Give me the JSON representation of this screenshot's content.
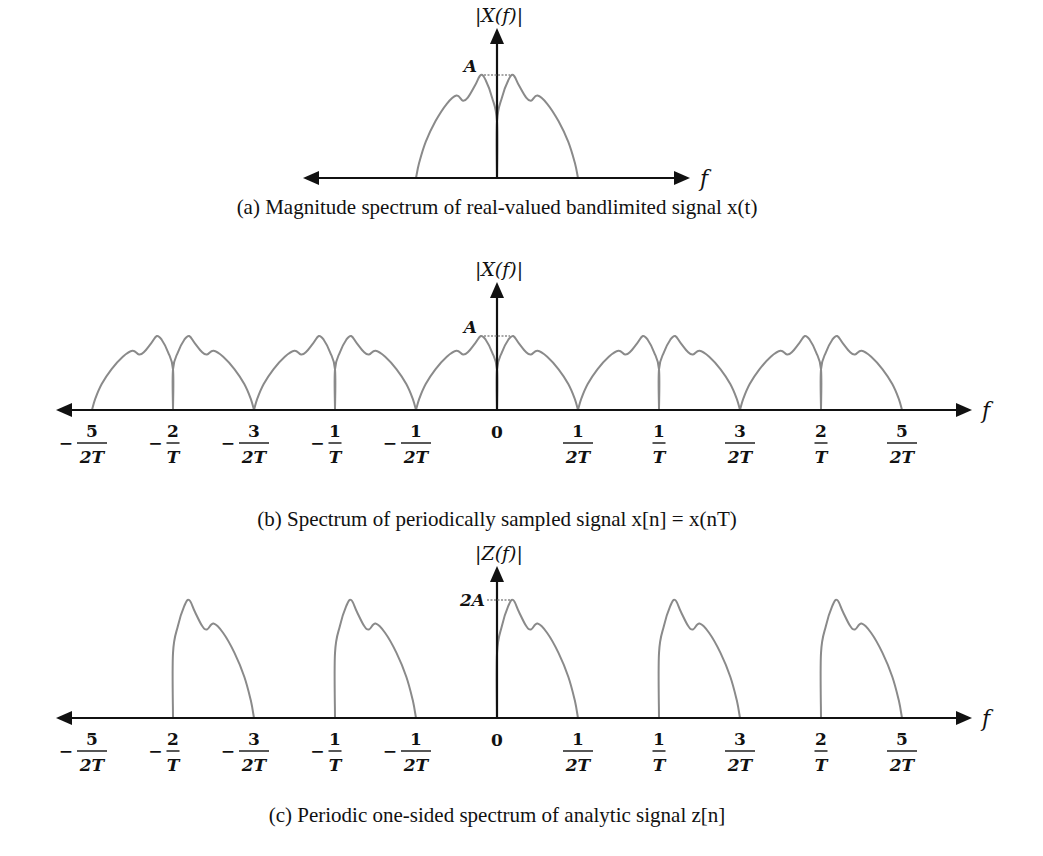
{
  "panels": [
    {
      "id": "a",
      "caption": "(a) Magnitude spectrum of real-valued bandlimited signal x(t)",
      "y_label": "|X(f)|",
      "x_label": "f",
      "level_label": "A",
      "lobe_width": 81,
      "center_x": 497,
      "axis_y": 178,
      "axis_x_range": [
        303,
        690
      ],
      "y_arrow_top": 28,
      "level_y": 75,
      "lobes": [
        {
          "start": -1,
          "mirror": true
        },
        {
          "start": 0,
          "mirror": false
        }
      ],
      "ticks": []
    },
    {
      "id": "b",
      "caption": "(b) Spectrum of periodically sampled signal x[n] = x(nT)",
      "y_label": "|X(f)|",
      "x_label": "f",
      "level_label": "A",
      "lobe_width": 81,
      "center_x": 497,
      "axis_y": 410,
      "axis_x_range": [
        56,
        972
      ],
      "y_arrow_top": 282,
      "level_y": 336,
      "lobes": [
        {
          "start": -5,
          "mirror": true
        },
        {
          "start": -4,
          "mirror": false
        },
        {
          "start": -3,
          "mirror": true
        },
        {
          "start": -2,
          "mirror": false
        },
        {
          "start": -1,
          "mirror": true
        },
        {
          "start": 0,
          "mirror": false
        },
        {
          "start": 1,
          "mirror": true
        },
        {
          "start": 2,
          "mirror": false
        },
        {
          "start": 3,
          "mirror": true
        },
        {
          "start": 4,
          "mirror": false
        }
      ],
      "ticks": [
        {
          "k": -5,
          "sign": "−",
          "num": "5",
          "den": "2T"
        },
        {
          "k": -4,
          "sign": "−",
          "num": "2",
          "den": "T"
        },
        {
          "k": -3,
          "sign": "−",
          "num": "3",
          "den": "2T"
        },
        {
          "k": -2,
          "sign": "−",
          "num": "1",
          "den": "T"
        },
        {
          "k": -1,
          "sign": "−",
          "num": "1",
          "den": "2T"
        },
        {
          "k": 0,
          "sign": "",
          "num": "0",
          "den": ""
        },
        {
          "k": 1,
          "sign": "",
          "num": "1",
          "den": "2T"
        },
        {
          "k": 2,
          "sign": "",
          "num": "1",
          "den": "T"
        },
        {
          "k": 3,
          "sign": "",
          "num": "3",
          "den": "2T"
        },
        {
          "k": 4,
          "sign": "",
          "num": "2",
          "den": "T"
        },
        {
          "k": 5,
          "sign": "",
          "num": "5",
          "den": "2T"
        }
      ]
    },
    {
      "id": "c",
      "caption": "(c) Periodic one-sided spectrum of analytic signal z[n]",
      "y_label": "|Z(f)|",
      "x_label": "f",
      "level_label": "2A",
      "lobe_width": 81,
      "center_x": 497,
      "axis_y": 718,
      "axis_x_range": [
        56,
        972
      ],
      "y_arrow_top": 566,
      "level_y": 600,
      "lobes": [
        {
          "start": -4,
          "mirror": false
        },
        {
          "start": -2,
          "mirror": false
        },
        {
          "start": 0,
          "mirror": false
        },
        {
          "start": 2,
          "mirror": false
        },
        {
          "start": 4,
          "mirror": false
        }
      ],
      "ticks": [
        {
          "k": -5,
          "sign": "−",
          "num": "5",
          "den": "2T"
        },
        {
          "k": -4,
          "sign": "−",
          "num": "2",
          "den": "T"
        },
        {
          "k": -3,
          "sign": "−",
          "num": "3",
          "den": "2T"
        },
        {
          "k": -2,
          "sign": "−",
          "num": "1",
          "den": "T"
        },
        {
          "k": -1,
          "sign": "−",
          "num": "1",
          "den": "2T"
        },
        {
          "k": 0,
          "sign": "",
          "num": "0",
          "den": ""
        },
        {
          "k": 1,
          "sign": "",
          "num": "1",
          "den": "2T"
        },
        {
          "k": 2,
          "sign": "",
          "num": "1",
          "den": "T"
        },
        {
          "k": 3,
          "sign": "",
          "num": "3",
          "den": "2T"
        },
        {
          "k": 4,
          "sign": "",
          "num": "2",
          "den": "T"
        },
        {
          "k": 5,
          "sign": "",
          "num": "5",
          "den": "2T"
        }
      ]
    }
  ],
  "lobe_shape": {
    "note": "normalized lobe profile from band edge at origin (x=0) to outer edge (x=1); y = fraction of axis-to-level height",
    "points": [
      [
        0,
        0.0
      ],
      [
        0.0,
        0.55
      ],
      [
        0.06,
        0.78
      ],
      [
        0.14,
        0.95
      ],
      [
        0.2,
        1.0
      ],
      [
        0.27,
        0.9
      ],
      [
        0.36,
        0.78
      ],
      [
        0.42,
        0.75
      ],
      [
        0.5,
        0.8
      ],
      [
        0.62,
        0.72
      ],
      [
        0.76,
        0.55
      ],
      [
        0.88,
        0.35
      ],
      [
        0.96,
        0.15
      ],
      [
        1.0,
        0.0
      ]
    ]
  },
  "chart_data": [
    {
      "type": "line",
      "title": "(a) Magnitude spectrum of real-valued bandlimited signal x(t)",
      "xlabel": "f",
      "ylabel": "|X(f)|",
      "annotations": [
        "A"
      ],
      "description": "Symmetric bandlimited magnitude spectrum around f=0, peak level A near the center with a notch at f=0",
      "x_range_normalized": [
        -0.5,
        0.5
      ],
      "peak": "A"
    },
    {
      "type": "line",
      "title": "(b) Spectrum of periodically sampled signal x[n] = x(nT)",
      "xlabel": "f",
      "ylabel": "|X(f)|",
      "tick_labels": [
        "-5/2T",
        "-2/T",
        "-3/2T",
        "-1/T",
        "-1/2T",
        "0",
        "1/2T",
        "1/T",
        "3/2T",
        "2/T",
        "5/2T"
      ],
      "annotations": [
        "A"
      ],
      "description": "Periodic replicas of spectrum (a) repeating every 1/T, filling -5/2T to 5/2T; peak level A",
      "peak": "A"
    },
    {
      "type": "line",
      "title": "(c) Periodic one-sided spectrum of analytic signal z[n]",
      "xlabel": "f",
      "ylabel": "|Z(f)|",
      "tick_labels": [
        "-5/2T",
        "-2/T",
        "-3/2T",
        "-1/T",
        "-1/2T",
        "0",
        "1/2T",
        "1/T",
        "3/2T",
        "2/T",
        "5/2T"
      ],
      "annotations": [
        "2A"
      ],
      "description": "One-sided (positive-frequency) lobes repeated periodically: lobes over [-2/T,-3/2T], [-1/T,-1/2T], [0,1/2T], [1/T,3/2T], [2/T,5/2T]; peak level 2A",
      "peak": "2A"
    }
  ]
}
